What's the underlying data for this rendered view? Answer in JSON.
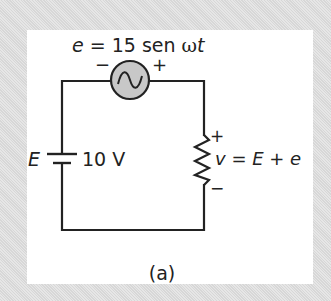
{
  "diagram": {
    "type": "electrical-circuit",
    "caption": "(a)",
    "ac_source": {
      "equation_var": "e",
      "equation_eq": " = 15 sen ",
      "equation_omega": "ω",
      "equation_t": "t",
      "minus": "−",
      "plus": "+"
    },
    "dc_source": {
      "symbol": "E",
      "value": "10 V"
    },
    "resistor": {
      "plus": "+",
      "minus": "−",
      "voltage_var": "v",
      "voltage_eq": " = ",
      "voltage_E": "E",
      "voltage_plus": " + ",
      "voltage_e": "e"
    },
    "colors": {
      "background": "#dedede",
      "panel": "#ffffff",
      "wire": "#222222",
      "source_fill": "#c8c8c8"
    }
  }
}
